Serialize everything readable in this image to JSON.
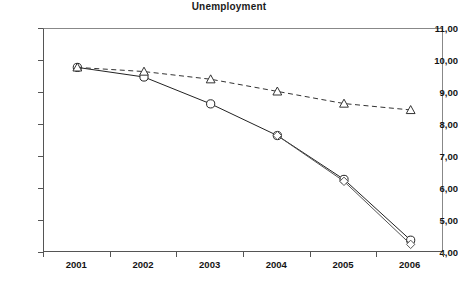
{
  "chart_data": {
    "type": "line",
    "title": "Unemployment",
    "xlabel": "",
    "ylabel": "",
    "categories": [
      "2001",
      "2002",
      "2003",
      "2004",
      "2005",
      "2006"
    ],
    "ylim": [
      4.0,
      11.0
    ],
    "ytick_labels": [
      "4,00",
      "5,00",
      "6,00",
      "7,00",
      "8,00",
      "9,00",
      "10,00",
      "11,00"
    ],
    "ytick_values": [
      4.0,
      5.0,
      6.0,
      7.0,
      8.0,
      9.0,
      10.0,
      11.0
    ],
    "grid": false,
    "legend": "none",
    "decimal_separator": ",",
    "series": [
      {
        "name": "actual",
        "style": "solid",
        "marker": "circle",
        "color": "#222222",
        "values": [
          9.8,
          9.5,
          8.66,
          7.67,
          6.3,
          4.4
        ]
      },
      {
        "name": "baseline",
        "style": "dashed",
        "marker": "triangle-up",
        "color": "#333333",
        "values": [
          9.8,
          9.67,
          9.43,
          9.05,
          8.67,
          8.47
        ]
      },
      {
        "name": "alternative",
        "style": "solid",
        "marker": "diamond",
        "color": "#555555",
        "values": [
          null,
          null,
          null,
          7.67,
          6.24,
          4.27
        ]
      }
    ]
  },
  "axis": {
    "y_tick_labels": [
      {
        "text": "11,00",
        "value": 11.0
      },
      {
        "text": "10,00",
        "value": 10.0
      },
      {
        "text": "9,00",
        "value": 9.0
      },
      {
        "text": "8,00",
        "value": 8.0
      },
      {
        "text": "7,00",
        "value": 7.0
      },
      {
        "text": "6,00",
        "value": 6.0
      },
      {
        "text": "5,00",
        "value": 5.0
      },
      {
        "text": "4,00",
        "value": 4.0
      }
    ],
    "x_tick_labels": [
      "2001",
      "2002",
      "2003",
      "2004",
      "2005",
      "2006"
    ]
  }
}
